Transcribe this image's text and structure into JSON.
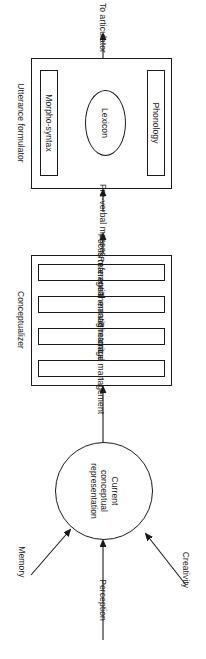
{
  "figure": {
    "title_implied": "Language production model",
    "orientation": "rotated-90",
    "stroke_color": "#1a1a1a",
    "background_color": "#ffffff"
  },
  "output": {
    "label": "To articulator"
  },
  "utterance_formulator": {
    "label": "Utterance formulator",
    "components": [
      {
        "label": "Morpho-syntax",
        "shape": "rect"
      },
      {
        "label": "Lexicon",
        "shape": "ellipse"
      },
      {
        "label": "Phonology",
        "shape": "rect"
      }
    ]
  },
  "link": {
    "label": "Pre-verbal message"
  },
  "conceptualizer": {
    "label": "Conceptualizer",
    "stages": [
      {
        "label": "Focus management"
      },
      {
        "label": "Referential management"
      },
      {
        "label": "Thematic management"
      },
      {
        "label": "Rhetorical management"
      }
    ]
  },
  "knowledge_base": {
    "label_line1": "Current",
    "label_line2": "conceptual",
    "label_line3": "representation",
    "label_full": "Current conceptual representation"
  },
  "inputs": [
    {
      "label": "Memory"
    },
    {
      "label": "Perception"
    },
    {
      "label": "Creativity"
    }
  ]
}
